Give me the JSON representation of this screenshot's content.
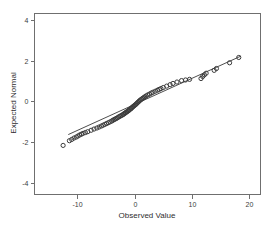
{
  "chart_data": {
    "type": "scatter",
    "title": "",
    "subtitle": "",
    "xlabel": "Observed Value",
    "ylabel": "Expected Normal",
    "xlim": [
      -17.5,
      22.0
    ],
    "ylim": [
      -4.55,
      4.3
    ],
    "xticks": [
      -10,
      0,
      10,
      20
    ],
    "xticklabels": [
      "-10",
      "0",
      "10",
      "20"
    ],
    "yticks": [
      4,
      2,
      0,
      -2,
      -4
    ],
    "yticklabels": [
      "4",
      "2",
      "0",
      "-2",
      "-4"
    ],
    "grid": false,
    "legend": null,
    "marker": "open-circle",
    "marker_color": "#3c3c3c",
    "line_color": "#3a3a3a",
    "reference_line": {
      "label": "normal reference line",
      "x0": -11.6,
      "y0": -1.62,
      "x1": 18.6,
      "y1": 2.22
    },
    "series": [
      {
        "name": "Observed vs Expected Normal",
        "x": [
          -12.5,
          -11.4,
          -11.0,
          -10.6,
          -10.2,
          -9.9,
          -9.6,
          -9.3,
          -9.0,
          -8.6,
          -8.2,
          -7.6,
          -7.1,
          -6.6,
          -6.2,
          -5.8,
          -5.5,
          -5.2,
          -4.9,
          -4.6,
          -4.3,
          -4.0,
          -3.8,
          -3.6,
          -3.4,
          -3.2,
          -3.0,
          -2.8,
          -2.6,
          -2.4,
          -2.2,
          -2.0,
          -1.9,
          -1.7,
          -1.6,
          -1.4,
          -1.3,
          -1.1,
          -1.0,
          -0.9,
          -0.7,
          -0.6,
          -0.5,
          -0.35,
          -0.2,
          -0.05,
          0.1,
          0.25,
          0.4,
          0.55,
          0.7,
          0.85,
          1.0,
          1.2,
          1.4,
          1.6,
          1.8,
          2.0,
          2.3,
          2.6,
          2.9,
          3.2,
          3.6,
          4.0,
          4.3,
          4.6,
          5.0,
          5.6,
          6.2,
          6.7,
          7.4,
          8.2,
          8.9,
          9.6,
          11.6,
          11.9,
          12.2,
          12.5,
          13.9,
          14.3,
          16.6,
          18.2
        ],
        "y": [
          -2.15,
          -1.92,
          -1.86,
          -1.79,
          -1.74,
          -1.69,
          -1.64,
          -1.6,
          -1.56,
          -1.52,
          -1.48,
          -1.41,
          -1.35,
          -1.3,
          -1.25,
          -1.2,
          -1.16,
          -1.12,
          -1.08,
          -1.04,
          -1.0,
          -0.96,
          -0.92,
          -0.89,
          -0.86,
          -0.83,
          -0.8,
          -0.76,
          -0.73,
          -0.7,
          -0.67,
          -0.64,
          -0.61,
          -0.58,
          -0.55,
          -0.52,
          -0.49,
          -0.46,
          -0.43,
          -0.4,
          -0.37,
          -0.34,
          -0.31,
          -0.27,
          -0.24,
          -0.2,
          -0.17,
          -0.13,
          -0.09,
          -0.05,
          -0.01,
          0.03,
          0.07,
          0.11,
          0.15,
          0.19,
          0.23,
          0.27,
          0.32,
          0.36,
          0.41,
          0.45,
          0.5,
          0.55,
          0.59,
          0.63,
          0.68,
          0.75,
          0.82,
          0.88,
          0.95,
          1.02,
          1.05,
          1.08,
          1.12,
          1.22,
          1.3,
          1.38,
          1.52,
          1.61,
          1.89,
          2.15
        ]
      }
    ]
  },
  "axes": {
    "x_title": "Observed Value",
    "y_title": "Expected Normal"
  }
}
